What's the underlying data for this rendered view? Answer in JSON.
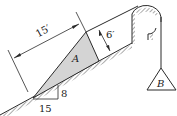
{
  "diagram": {
    "type": "statics-problem",
    "block_a": {
      "label": "A",
      "fill": "#d4d4d4"
    },
    "weight_b": {
      "label": "B"
    },
    "dimensions": {
      "length_label": "15′",
      "height_label": "6′"
    },
    "slope": {
      "rise_label": "8",
      "run_label": "15"
    },
    "colors": {
      "stroke": "#2a2a2a",
      "hatch": "#555555",
      "block_fill": "#d4d4d4"
    }
  }
}
